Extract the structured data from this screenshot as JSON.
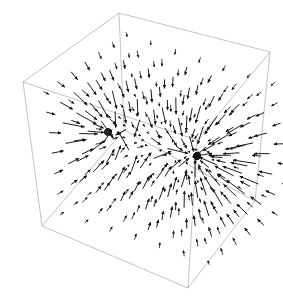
{
  "figure": {
    "background_color": "#ffffff",
    "width": 283,
    "height": 302,
    "title": "",
    "axis_labels": {
      "x": "",
      "y": "",
      "z": ""
    },
    "tick_labels": []
  },
  "chart_data": {
    "type": "scatter",
    "subtype": "quiver-3d",
    "title": "",
    "xlabel": "",
    "ylabel": "",
    "zlabel": "",
    "grid": false,
    "legend": null,
    "arrow_color": "#111111",
    "box_color": "#9a9a9a",
    "box_linewidth": 0.6,
    "projection": "axonometric",
    "box_vertices": {
      "top_back": [
        119,
        13
      ],
      "top_left": [
        23,
        82
      ],
      "top_right": [
        270,
        52
      ],
      "top_front": [
        197,
        140
      ],
      "bottom_left": [
        42,
        226
      ],
      "bottom_front": [
        188,
        288
      ],
      "bottom_right": [
        255,
        201
      ],
      "bottom_back_hidden": [
        124,
        130
      ]
    },
    "singularities": [
      {
        "name": "left-sink",
        "screen": [
          108,
          132
        ],
        "strength": 0.55,
        "density": 9
      },
      {
        "name": "right-sink",
        "screen": [
          197,
          156
        ],
        "strength": 1.0,
        "density": 26
      }
    ],
    "grid_dims": [
      7,
      7,
      7
    ],
    "arrow_count": 343
  }
}
